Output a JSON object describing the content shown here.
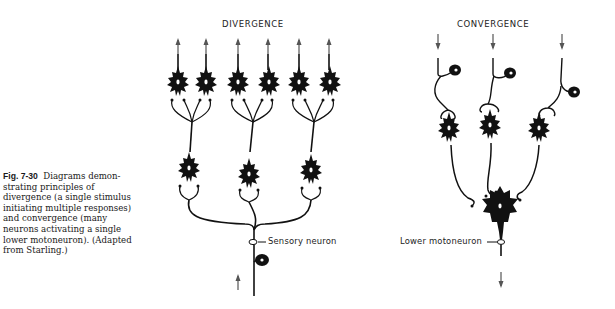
{
  "figure": {
    "number": "Fig. 7-30",
    "caption": "Diagrams demonstrating principles of divergence (a single stimulus initiating multiple responses) and convergence (many neurons activating a single lower motoneuron). (Adapted from Starling.)",
    "caption_lines": [
      "Diagrams demon-",
      "strating principles of",
      "divergence (a single stimulus",
      "initiating multiple responses)",
      "and convergence (many",
      "neurons activating a single",
      "lower motoneuron). (Adapted",
      "from Starling.)"
    ]
  },
  "diagrams": {
    "divergence": {
      "title": "DIVERGENCE",
      "input_label": "Sensory neuron",
      "input_arrow": "up-arrow",
      "first_order_neurons": 3,
      "output_neurons": 6,
      "output_arrows": "up-arrow"
    },
    "convergence": {
      "title": "CONVERGENCE",
      "output_label": "Lower motoneuron",
      "input_arrows": 3,
      "interneurons": 3,
      "output_arrow": "down-arrow"
    }
  },
  "colors": {
    "ink": "#111111",
    "arrow": "#555555",
    "background": "#ffffff"
  }
}
